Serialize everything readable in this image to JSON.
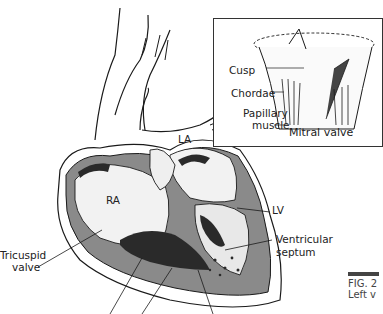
{
  "figure": {
    "type": "anatomical illustration",
    "caption_fragment_1": "FIG. 2",
    "caption_fragment_2": "Left v"
  },
  "inset": {
    "title": "Mitral valve",
    "labels": {
      "cusp": "Cusp",
      "chordae": "Chordae",
      "papillary_1": "Papillary",
      "papillary_2": "muscle"
    }
  },
  "main": {
    "labels": {
      "la": "LA",
      "ra": "RA",
      "lv": "LV",
      "tricuspid_1": "Tricuspid",
      "tricuspid_2": "valve",
      "septum_1": "Ventricular",
      "septum_2": "septum"
    }
  },
  "colors": {
    "line": "#1a1a1a",
    "wall_gray": "#8a8a8a",
    "dark_fill": "#2a2a2a"
  }
}
